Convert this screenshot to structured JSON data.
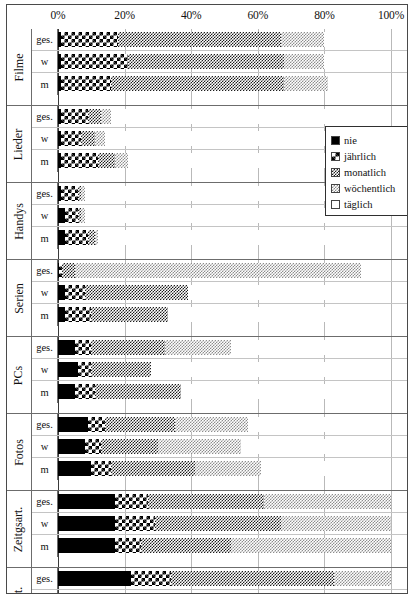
{
  "chart_data": {
    "type": "bar",
    "orientation": "horizontal",
    "stacked": true,
    "stack_total": 100,
    "title": "",
    "subtitle": "",
    "xlabel": "",
    "ylabel": "",
    "xlim": [
      0,
      100
    ],
    "x_tick_labels": [
      "0%",
      "20%",
      "40%",
      "60%",
      "80%",
      "100%"
    ],
    "x_ticks": [
      0,
      20,
      40,
      60,
      80,
      100
    ],
    "grid": true,
    "grid_axis": "x",
    "legend_position": "inside-right-upper",
    "legend_entries": [
      "nie",
      "jährlich",
      "monatlich",
      "wöchentlich",
      "täglich"
    ],
    "series": [
      {
        "name": "nie",
        "pattern": "solid-black",
        "color": "#000000"
      },
      {
        "name": "jährlich",
        "pattern": "large-checker",
        "color": "#000000"
      },
      {
        "name": "monatlich",
        "pattern": "fine-checker-dark",
        "color": "#1c1c1c"
      },
      {
        "name": "wöchentlich",
        "pattern": "fine-checker-light",
        "color": "#8d8d8d"
      },
      {
        "name": "täglich",
        "pattern": "sparse-dots",
        "color": "#9a9a9a"
      }
    ],
    "groups": [
      {
        "category": "Filme",
        "rows": [
          {
            "label": "ges.",
            "values": [
              1,
              17,
              49,
              13,
              20
            ]
          },
          {
            "label": "w",
            "values": [
              1,
              20,
              47,
              12,
              20
            ]
          },
          {
            "label": "m",
            "values": [
              1,
              15,
              52,
              13,
              19
            ]
          }
        ]
      },
      {
        "category": "Lieder",
        "rows": [
          {
            "label": "ges.",
            "values": [
              1,
              8,
              4,
              3,
              84
            ]
          },
          {
            "label": "w",
            "values": [
              1,
              6,
              4,
              3,
              86
            ]
          },
          {
            "label": "m",
            "values": [
              1,
              11,
              5,
              4,
              79
            ]
          }
        ]
      },
      {
        "category": "Handys",
        "rows": [
          {
            "label": "ges.",
            "values": [
              1,
              5,
              1,
              1,
              92
            ]
          },
          {
            "label": "w",
            "values": [
              2,
              4,
              1,
              1,
              92
            ]
          },
          {
            "label": "m",
            "values": [
              2,
              7,
              2,
              1,
              88
            ]
          }
        ]
      },
      {
        "category": "Serien",
        "rows": [
          {
            "label": "ges.",
            "values": [
              2,
              7,
              27,
              600,
              64
            ]
          },
          {
            "label": "w",
            "values": [
              2,
              6,
              31,
              0,
              61
            ]
          },
          {
            "label": "m",
            "values": [
              2,
              8,
              23,
              0,
              67
            ]
          }
        ]
      },
      {
        "category": "PCs",
        "rows": [
          {
            "label": "ges.",
            "values": [
              5,
              5,
              22,
              20,
              48
            ]
          },
          {
            "label": "w",
            "values": [
              6,
              4,
              18,
              0,
              72
            ]
          },
          {
            "label": "m",
            "values": [
              5,
              6,
              26,
              0,
              63
            ]
          }
        ]
      },
      {
        "category": "Fotos",
        "rows": [
          {
            "label": "ges.",
            "values": [
              9,
              5,
              21,
              22,
              43
            ]
          },
          {
            "label": "w",
            "values": [
              8,
              5,
              17,
              25,
              45
            ]
          },
          {
            "label": "m",
            "values": [
              10,
              6,
              25,
              20,
              39
            ]
          }
        ]
      },
      {
        "category": "Zeitgsart.",
        "rows": [
          {
            "label": "ges.",
            "values": [
              17,
              10,
              35,
              38,
              0
            ]
          },
          {
            "label": "w",
            "values": [
              17,
              12,
              38,
              33,
              0
            ]
          },
          {
            "label": "m",
            "values": [
              17,
              8,
              27,
              48,
              0
            ]
          }
        ]
      },
      {
        "category": "Zeitsart.",
        "rows": [
          {
            "label": "ges.",
            "values": [
              22,
              12,
              49,
              17,
              0
            ]
          },
          {
            "label": "w",
            "values": [
              23,
              13,
              39,
              25,
              0
            ]
          },
          {
            "label": "m",
            "values": [
              22,
              12,
              42,
              24,
              0
            ]
          }
        ]
      }
    ]
  }
}
